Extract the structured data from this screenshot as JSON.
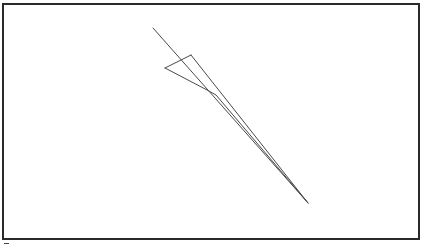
{
  "diagram": {
    "width": 421,
    "height": 247,
    "frame": {
      "x": 3,
      "y": 4,
      "width": 416,
      "height": 235,
      "stroke": "#2a2a2a"
    },
    "line_color": "#4a4a4a",
    "shapes": [
      {
        "name": "long-diagonal-line",
        "points": [
          [
            153,
            28
          ],
          [
            308,
            203
          ]
        ]
      },
      {
        "name": "upper-edge-line",
        "points": [
          [
            191,
            55
          ],
          [
            308,
            203
          ]
        ]
      },
      {
        "name": "top-short-edge",
        "points": [
          [
            165,
            68
          ],
          [
            191,
            55
          ]
        ]
      },
      {
        "name": "lower-bent-line",
        "points": [
          [
            165,
            68
          ],
          [
            209,
            91
          ],
          [
            216,
            95
          ],
          [
            308,
            203
          ]
        ]
      }
    ]
  }
}
